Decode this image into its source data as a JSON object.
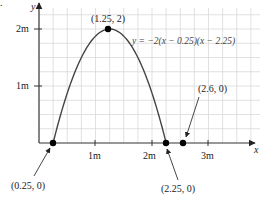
{
  "chart_data": {
    "type": "line",
    "title": "",
    "xlabel": "x",
    "ylabel": "y",
    "equation": "y = −2(x − 0.25)(x − 2.25)",
    "xlim": [
      0,
      3.9
    ],
    "ylim": [
      0,
      2.45
    ],
    "x_ticks": [
      "1m",
      "2m",
      "3m"
    ],
    "y_ticks": [
      "1m",
      "2m"
    ],
    "grid": true,
    "series": [
      {
        "name": "parabola",
        "function": "-2*(x-0.25)*(x-2.25)",
        "x_range": [
          0.25,
          2.25
        ]
      }
    ],
    "points": [
      {
        "label": "(0.25, 0)",
        "x": 0.25,
        "y": 0
      },
      {
        "label": "(1.25, 2)",
        "x": 1.25,
        "y": 2
      },
      {
        "label": "(2.25, 0)",
        "x": 2.25,
        "y": 0
      },
      {
        "label": "(2.6, 0)",
        "x": 2.6,
        "y": 0
      }
    ]
  },
  "labels": {
    "y_axis": "y",
    "x_axis": "x",
    "tick_1m_x": "1m",
    "tick_2m_x": "2m",
    "tick_3m_x": "3m",
    "tick_1m_y": "1m",
    "tick_2m_y": "2m",
    "equation": "y = −2(x − 0.25)(x − 2.25)",
    "p_vertex": "(1.25, 2)",
    "p_root1": "(0.25, 0)",
    "p_root2": "(2.25, 0)",
    "p_other": "(2.6, 0)",
    "corner_fragment": "."
  },
  "colors": {
    "grid": "#d9d9d9",
    "axis": "#333333",
    "curve": "#444444",
    "point": "#000000"
  }
}
